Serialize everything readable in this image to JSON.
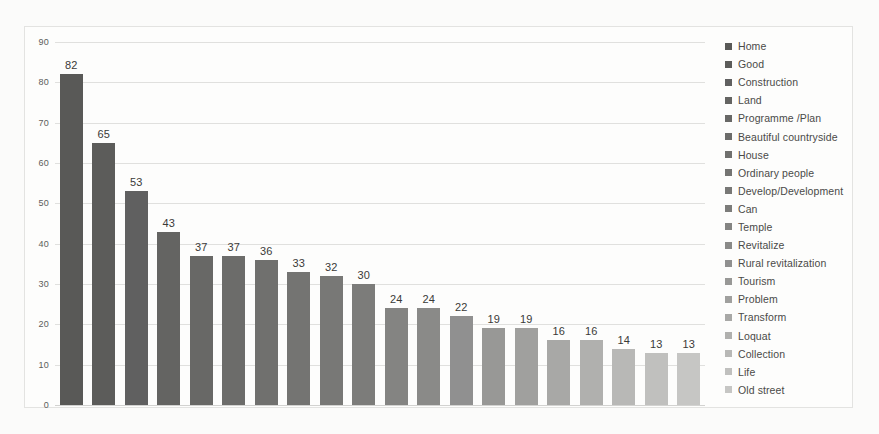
{
  "chart_data": {
    "type": "bar",
    "title": "",
    "xlabel": "",
    "ylabel": "",
    "ylim": [
      0,
      90
    ],
    "ytick_values": [
      90,
      80,
      70,
      60,
      50,
      40,
      30,
      20,
      10,
      0
    ],
    "ytick_labels": [
      "90",
      "80",
      "70",
      "60",
      "50",
      "40",
      "30",
      "20",
      "10",
      "0"
    ],
    "grid": true,
    "legend_position": "right",
    "categories": [
      "Home",
      "Good",
      "Construction",
      "Land",
      "Programme /Plan",
      "Beautiful countryside",
      "House",
      "Ordinary people",
      "Develop/Development",
      "Can",
      "Temple",
      "Revitalize",
      "Rural revitalization",
      "Tourism",
      "Problem",
      "Transform",
      "Loquat",
      "Collection",
      "Life",
      "Old street"
    ],
    "values": [
      82,
      65,
      53,
      43,
      37,
      37,
      36,
      33,
      32,
      30,
      24,
      24,
      22,
      19,
      19,
      16,
      16,
      14,
      13,
      13
    ],
    "value_labels": [
      "82",
      "65",
      "53",
      "43",
      "37",
      "37",
      "36",
      "33",
      "32",
      "30",
      "24",
      "24",
      "22",
      "19",
      "19",
      "16",
      "16",
      "14",
      "13",
      "13"
    ],
    "bar_colors": [
      "#595957",
      "#5c5c5a",
      "#606060",
      "#646462",
      "#686866",
      "#6c6c6a",
      "#70706e",
      "#747472",
      "#787876",
      "#7c7c7a",
      "#848482",
      "#8a8a88",
      "#909090",
      "#989896",
      "#a0a09e",
      "#a8a8a6",
      "#b0b0ae",
      "#b8b8b6",
      "#c0c0be",
      "#c6c6c4"
    ]
  },
  "legend": {
    "items": [
      {
        "label": "Home",
        "color": "#595957"
      },
      {
        "label": "Good",
        "color": "#5c5c5a"
      },
      {
        "label": "Construction",
        "color": "#606060"
      },
      {
        "label": "Land",
        "color": "#646462"
      },
      {
        "label": "Programme /Plan",
        "color": "#686866"
      },
      {
        "label": "Beautiful countryside",
        "color": "#6c6c6a"
      },
      {
        "label": "House",
        "color": "#70706e"
      },
      {
        "label": "Ordinary people",
        "color": "#747472"
      },
      {
        "label": "Develop/Development",
        "color": "#787876"
      },
      {
        "label": "Can",
        "color": "#7c7c7a"
      },
      {
        "label": "Temple",
        "color": "#848482"
      },
      {
        "label": "Revitalize",
        "color": "#8a8a88"
      },
      {
        "label": "Rural revitalization",
        "color": "#909090"
      },
      {
        "label": "Tourism",
        "color": "#989896"
      },
      {
        "label": "Problem",
        "color": "#a0a09e"
      },
      {
        "label": "Transform",
        "color": "#a8a8a6"
      },
      {
        "label": "Loquat",
        "color": "#b0b0ae"
      },
      {
        "label": "Collection",
        "color": "#b8b8b6"
      },
      {
        "label": "Life",
        "color": "#c0c0be"
      },
      {
        "label": "Old street",
        "color": "#c6c6c4"
      }
    ]
  }
}
